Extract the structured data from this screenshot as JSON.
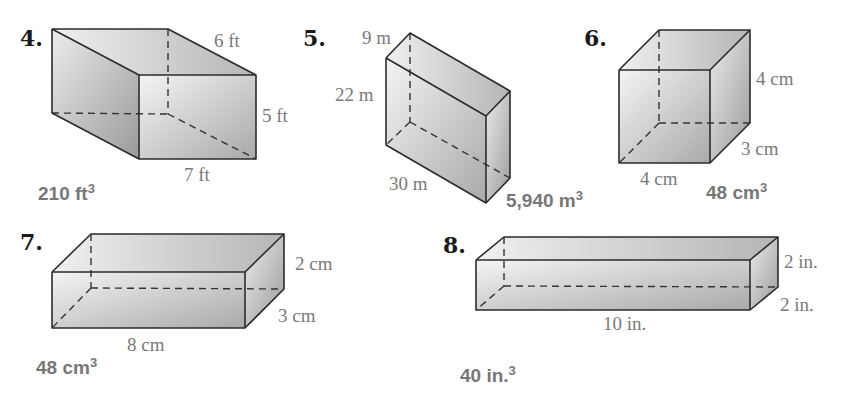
{
  "problems": [
    {
      "number": "4.",
      "dimensions": {
        "length": "7 ft",
        "width": "6 ft",
        "height": "5 ft"
      },
      "answer": {
        "value": "210 ft",
        "exp": "3"
      }
    },
    {
      "number": "5.",
      "dimensions": {
        "length": "30 m",
        "width": "9 m",
        "height": "22 m"
      },
      "answer": {
        "value": "5,940 m",
        "exp": "3"
      }
    },
    {
      "number": "6.",
      "dimensions": {
        "length": "4 cm",
        "width": "3 cm",
        "height": "4 cm"
      },
      "answer": {
        "value": "48 cm",
        "exp": "3"
      }
    },
    {
      "number": "7.",
      "dimensions": {
        "length": "8 cm",
        "width": "3 cm",
        "height": "2 cm"
      },
      "answer": {
        "value": "48 cm",
        "exp": "3"
      }
    },
    {
      "number": "8.",
      "dimensions": {
        "length": "10 in.",
        "width": "2 in.",
        "height": "2 in."
      },
      "answer": {
        "value": "40 in.",
        "exp": "3"
      }
    }
  ]
}
